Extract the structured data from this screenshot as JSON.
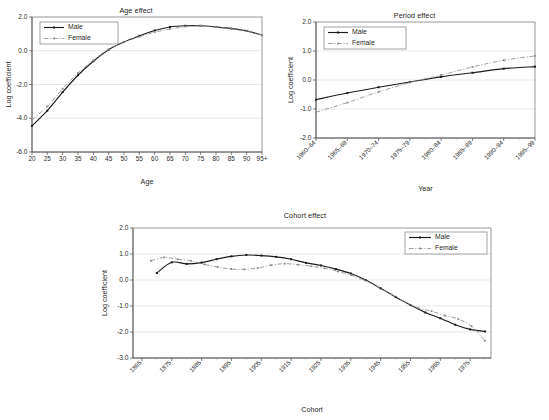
{
  "figure": {
    "background": "#ffffff",
    "male_color": "#1b1b1b",
    "female_color": "#8d8d8d",
    "grid_color": "#d8d8d8"
  },
  "chart_data": [
    {
      "id": "age-effect",
      "type": "line",
      "title": "Age effect",
      "xlabel": "Age",
      "ylabel": "Log coefficient",
      "ylim": [
        -6.0,
        2.0
      ],
      "yticks": [
        "2.0",
        "0.0",
        "-2.0",
        "-4.0",
        "-6.0"
      ],
      "ytick_values": [
        2.0,
        0.0,
        -2.0,
        -4.0,
        -6.0
      ],
      "grid": true,
      "legend_position": "top-left",
      "categories": [
        "20",
        "25",
        "30",
        "35",
        "40",
        "45",
        "50",
        "55",
        "60",
        "65",
        "70",
        "75",
        "80",
        "85",
        "90",
        "95+"
      ],
      "series": [
        {
          "name": "Male",
          "values": [
            -4.45,
            -3.55,
            -2.45,
            -1.45,
            -0.62,
            0.06,
            0.52,
            0.88,
            1.2,
            1.41,
            1.48,
            1.48,
            1.41,
            1.32,
            1.18,
            0.93
          ]
        },
        {
          "name": "Female",
          "values": [
            -4.1,
            -3.3,
            -2.25,
            -1.32,
            -0.57,
            0.08,
            0.5,
            0.83,
            1.1,
            1.28,
            1.43,
            1.47,
            1.4,
            1.3,
            1.17,
            0.93
          ]
        }
      ]
    },
    {
      "id": "period-effect",
      "type": "line",
      "title": "Period effect",
      "xlabel": "Year",
      "ylabel": "Log coefficient",
      "ylim": [
        -2.0,
        2.0
      ],
      "yticks": [
        "2.0",
        "1.0",
        "0.0",
        "-1.0",
        "-2.0"
      ],
      "ytick_values": [
        2.0,
        1.0,
        0.0,
        -1.0,
        -2.0
      ],
      "grid": true,
      "legend_position": "top-left",
      "categories": [
        "1960–64",
        "1965–69",
        "1970–74",
        "1975–79",
        "1980–84",
        "1985–89",
        "1990–94",
        "1995–99"
      ],
      "series": [
        {
          "name": "Male",
          "values": [
            -0.68,
            -0.45,
            -0.25,
            -0.07,
            0.11,
            0.25,
            0.39,
            0.46
          ]
        },
        {
          "name": "Female",
          "values": [
            -1.11,
            -0.78,
            -0.41,
            -0.09,
            0.17,
            0.45,
            0.68,
            0.83
          ]
        }
      ]
    },
    {
      "id": "cohort-effect",
      "type": "line",
      "title": "Cohort effect",
      "xlabel": "Cohort",
      "ylabel": "Log coefficient",
      "ylim": [
        -3.0,
        2.0
      ],
      "yticks": [
        "2.0",
        "1.0",
        "0.0",
        "-1.0",
        "-2.0",
        "-3.0"
      ],
      "ytick_values": [
        2.0,
        1.0,
        0.0,
        -1.0,
        -2.0,
        -3.0
      ],
      "grid": true,
      "legend_position": "top-right",
      "categories": [
        "1865",
        "1875",
        "1885",
        "1895",
        "1905",
        "1915",
        "1925",
        "1935",
        "1945",
        "1955",
        "1965",
        "1975"
      ],
      "x_points": [
        1870,
        1875,
        1880,
        1885,
        1890,
        1895,
        1900,
        1905,
        1910,
        1915,
        1920,
        1925,
        1930,
        1935,
        1940,
        1945,
        1950,
        1955,
        1960,
        1965,
        1970,
        1975,
        1980
      ],
      "series": [
        {
          "name": "Male",
          "values": [
            0.27,
            0.68,
            0.62,
            0.67,
            0.8,
            0.91,
            0.96,
            0.94,
            0.89,
            0.8,
            0.66,
            0.56,
            0.42,
            0.25,
            0.0,
            -0.32,
            -0.65,
            -0.96,
            -1.25,
            -1.47,
            -1.72,
            -1.9,
            -1.98
          ]
        },
        {
          "name": "Female",
          "values": [
            0.74,
            0.87,
            0.8,
            0.74,
            0.6,
            0.5,
            0.42,
            0.41,
            0.46,
            0.57,
            0.63,
            0.59,
            0.53,
            0.45,
            0.33,
            0.18,
            -0.02,
            -0.27,
            -0.55,
            -0.84,
            -1.08,
            -1.2,
            -1.37,
            -1.5,
            -1.78,
            -2.34
          ]
        }
      ]
    }
  ]
}
